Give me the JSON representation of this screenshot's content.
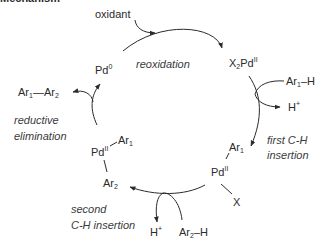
{
  "title": "Mechanism",
  "species": {
    "pd0": {
      "base": "Pd",
      "sup": "0"
    },
    "x2pd2": {
      "pre": "X",
      "pre_sub": "2",
      "base": "Pd",
      "sup": "II"
    },
    "pd2_ar_x": {
      "base": "Pd",
      "sup": "II",
      "ligand_top": "Ar",
      "ligand_top_sub": "1",
      "ligand_bottom": "X"
    },
    "pd2_ar_ar": {
      "base": "Pd",
      "sup": "II",
      "ligand_top": "Ar",
      "ligand_top_sub": "1",
      "ligand_bottom": "Ar",
      "ligand_bottom_sub": "2"
    }
  },
  "reagents": {
    "oxidant": "oxidant",
    "ar1h": {
      "base": "Ar",
      "sub": "1",
      "suffix": "–H"
    },
    "hplus_1": {
      "base": "H",
      "sup": "+"
    },
    "ar2h": {
      "base": "Ar",
      "sub": "2",
      "suffix": "–H"
    },
    "hplus_2": {
      "base": "H",
      "sup": "+"
    },
    "product": {
      "a": "Ar",
      "a_sub": "1",
      "bond": "—",
      "b": "Ar",
      "b_sub": "2"
    }
  },
  "steps": {
    "reoxidation": "reoxidation",
    "first_ch_line1": "first C-H",
    "first_ch_line2": "insertion",
    "second_ch_line1": "second",
    "second_ch_line2": "C-H insertion",
    "reductive_line1": "reductive",
    "reductive_line2": "elimination"
  },
  "colors": {
    "stroke": "#2b2b2b",
    "text": "#2b2b2b"
  }
}
